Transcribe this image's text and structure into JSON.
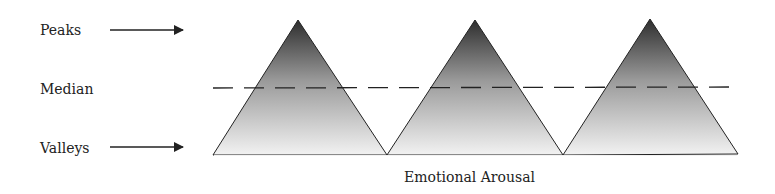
{
  "labels": {
    "peaks": "Peaks",
    "median": "Median",
    "valleys": "Valleys",
    "x_axis": "Emotional Arousal"
  },
  "colors": {
    "apex_fill": "#2e2e2e",
    "base_fill": "#f2f2f2",
    "stroke": "#222222",
    "text": "#222222"
  },
  "diagram": {
    "peak_count": 3,
    "median_line_style": "dashed",
    "arrows": [
      {
        "from": "Peaks",
        "direction": "right"
      },
      {
        "from": "Valleys",
        "direction": "right"
      }
    ]
  }
}
